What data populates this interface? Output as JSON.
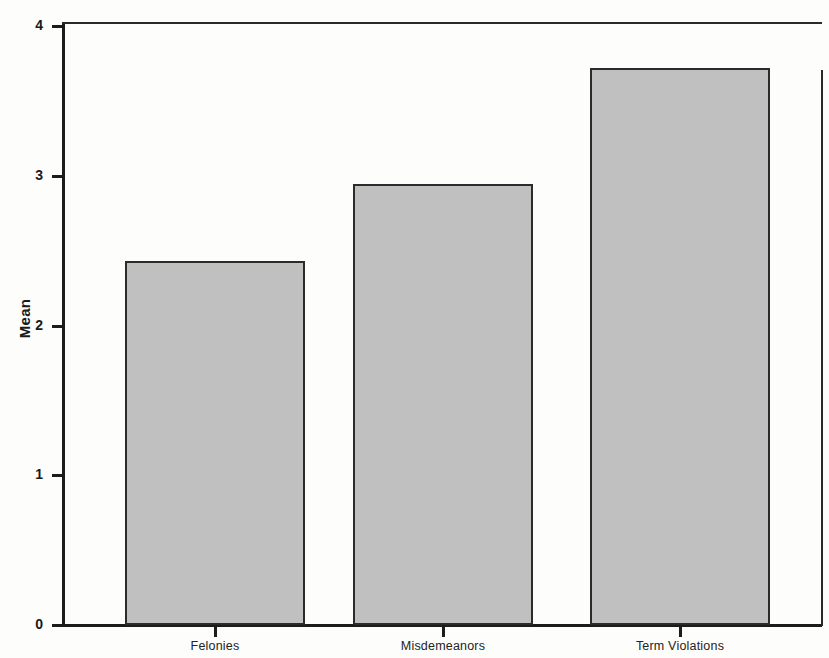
{
  "chart_data": {
    "type": "bar",
    "title": "",
    "subtitle": "",
    "xlabel": "",
    "ylabel": "Mean",
    "categories": [
      "Felonies",
      "Misdemeanors",
      "Term Violations"
    ],
    "values": [
      2.43,
      2.95,
      3.72
    ],
    "series": [
      {
        "name": "Mean",
        "values": [
          2.43,
          2.95,
          3.72
        ]
      }
    ],
    "ylim": [
      0,
      4.03
    ],
    "y_ticks": [
      0,
      1,
      2,
      3,
      4
    ],
    "y_tick_labels": [
      "0",
      "1",
      "2",
      "3",
      "4"
    ],
    "grid": false,
    "legend": null,
    "legend_position": "none",
    "bar_color": "#c0c0c0",
    "bar_edge_color": "#2b2b2b",
    "axis_color": "#1c1c1c",
    "background_color": "#fdfdfc"
  },
  "axis": {
    "y_title": "Mean"
  }
}
